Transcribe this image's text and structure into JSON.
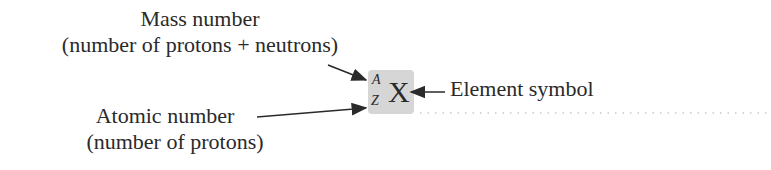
{
  "diagram": {
    "labels": {
      "mass_line1": "Mass number",
      "mass_line2": "(number of protons + neutrons)",
      "atomic_line1": "Atomic number",
      "atomic_line2": "(number of protons)",
      "element": "Element symbol"
    },
    "notation": {
      "symbol": "X",
      "superscript": "A",
      "subscript": "Z"
    },
    "colors": {
      "box": "#d6d6d6",
      "text": "#2a2a2a"
    }
  }
}
